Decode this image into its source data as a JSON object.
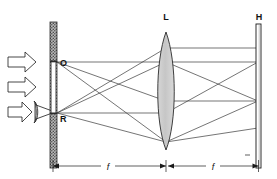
{
  "diagram": {
    "background_color": "#ffffff",
    "line_color": "#3a3a3a",
    "lens_fill": "#cfcfcf",
    "mount_fill": "#9a9a9a",
    "labels": {
      "lens": "L",
      "screen": "H",
      "object_top": "O",
      "object_bottom": "R",
      "focal_left": "f",
      "focal_right": "f"
    },
    "components": [
      {
        "name": "illumination-arrows",
        "label": "",
        "count": 3
      },
      {
        "name": "condenser",
        "label": ""
      },
      {
        "name": "slide-mount",
        "label": ""
      },
      {
        "name": "object-slide",
        "label": "O"
      },
      {
        "name": "converging-lens",
        "label": "L"
      },
      {
        "name": "projection-screen",
        "label": "H"
      }
    ],
    "dimensions": [
      {
        "name": "object-to-lens",
        "label": "f"
      },
      {
        "name": "lens-to-screen",
        "label": "f"
      }
    ]
  }
}
